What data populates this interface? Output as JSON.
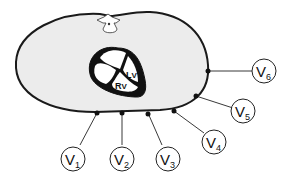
{
  "diagram": {
    "colors": {
      "body_fill": "#ececec",
      "outline": "#1a1a1a",
      "heart": "#111111",
      "background": "#ffffff"
    },
    "structures": {
      "spine": "vertebra",
      "heart_chambers": [
        {
          "id": "lv",
          "main": "L",
          "sub": "V"
        },
        {
          "id": "rv",
          "main": "R",
          "sub": "V"
        }
      ]
    },
    "leads": [
      {
        "id": "v1",
        "main": "V",
        "sub": "1"
      },
      {
        "id": "v2",
        "main": "V",
        "sub": "2"
      },
      {
        "id": "v3",
        "main": "V",
        "sub": "3"
      },
      {
        "id": "v4",
        "main": "V",
        "sub": "4"
      },
      {
        "id": "v5",
        "main": "V",
        "sub": "5"
      },
      {
        "id": "v6",
        "main": "V",
        "sub": "6"
      }
    ]
  }
}
